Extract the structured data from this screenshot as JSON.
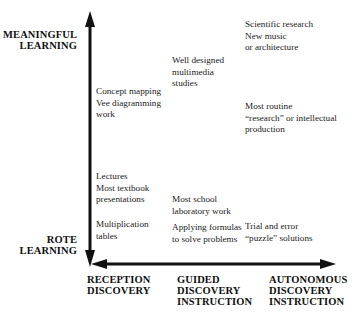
{
  "diagram": {
    "y_axis": {
      "top_label": [
        "MEANINGFUL",
        "LEARNING"
      ],
      "bottom_label": [
        "ROTE",
        "LEARNING"
      ]
    },
    "x_axis": {
      "labels": [
        [
          "RECEPTION",
          "DISCOVERY"
        ],
        [
          "GUIDED",
          "DISCOVERY",
          "INSTRUCTION"
        ],
        [
          "AUTONOMOUS",
          "DISCOVERY",
          "INSTRUCTION"
        ]
      ]
    },
    "items": [
      {
        "lines": [
          "Scientific research",
          "New music",
          "or architecture"
        ]
      },
      {
        "lines": [
          "Well designed",
          "multimedia",
          "studies"
        ]
      },
      {
        "lines": [
          "Concept mapping",
          "Vee diagramming",
          "work"
        ]
      },
      {
        "lines": [
          "Most routine",
          "“research” or intellectual",
          "production"
        ]
      },
      {
        "lines": [
          "Lectures",
          "Most textbook",
          "presentations"
        ]
      },
      {
        "lines": [
          "Most school",
          "laboratory work"
        ]
      },
      {
        "lines": [
          "Multiplication",
          "tables"
        ]
      },
      {
        "lines": [
          "Applying formulas",
          "to solve problems"
        ]
      },
      {
        "lines": [
          "Trial and error",
          "“puzzle” solutions"
        ]
      }
    ],
    "colors": {
      "axis": "#111111",
      "text": "#222222",
      "background": "#ffffff"
    }
  }
}
